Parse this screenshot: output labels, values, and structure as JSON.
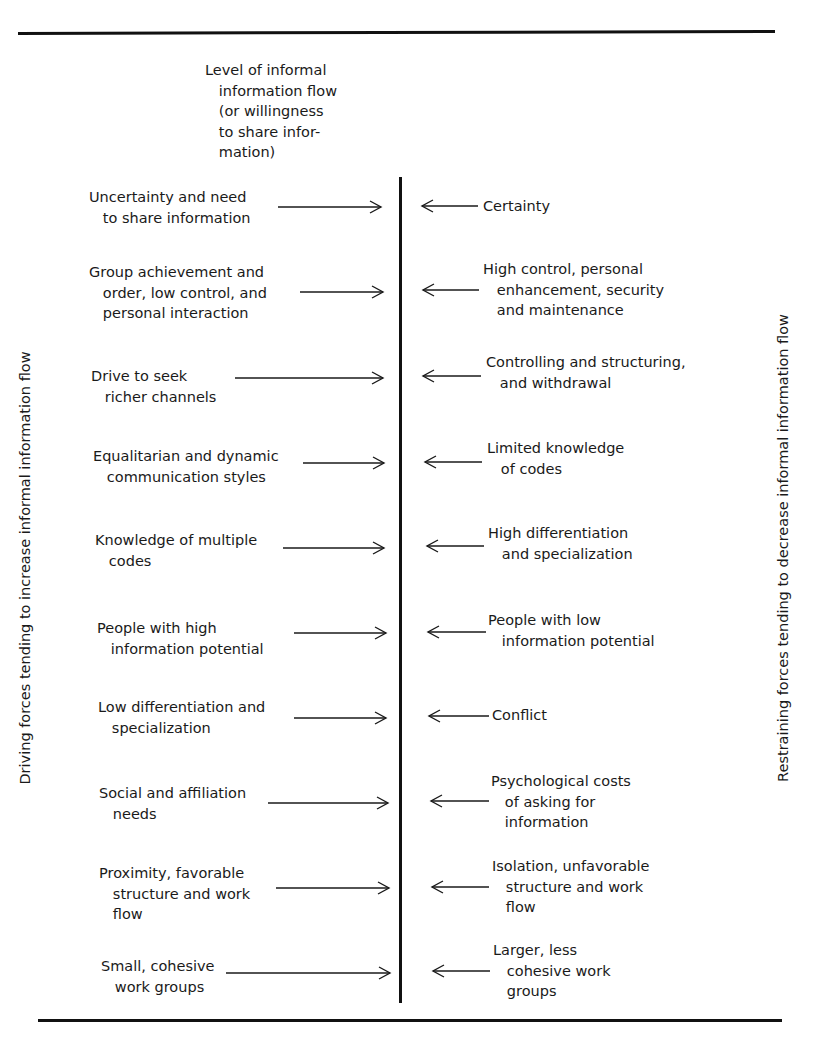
{
  "diagram": {
    "type": "force-field-analysis",
    "center_axis_label": "Level of informal\n   information flow\n   (or willingness\n   to share infor-\n   mation)",
    "left_side_label": "Driving forces tending to increase informal information flow",
    "right_side_label": "Restraining forces tending to decrease informal information flow",
    "driving_forces": [
      {
        "text": "Uncertainty and need\n   to share information"
      },
      {
        "text": "Group achievement and\n   order, low control, and\n   personal interaction"
      },
      {
        "text": "Drive to seek\n   richer channels"
      },
      {
        "text": "Equalitarian and dynamic\n   communication styles"
      },
      {
        "text": "Knowledge of multiple\n   codes"
      },
      {
        "text": "People with high\n   information potential"
      },
      {
        "text": "Low differentiation and\n   specialization"
      },
      {
        "text": "Social and affiliation\n   needs"
      },
      {
        "text": "Proximity, favorable\n   structure and work\n   flow"
      },
      {
        "text": "Small, cohesive\n   work groups"
      }
    ],
    "restraining_forces": [
      {
        "text": "Certainty"
      },
      {
        "text": "High control, personal\n   enhancement, security\n   and maintenance"
      },
      {
        "text": "Controlling and structuring,\n   and withdrawal"
      },
      {
        "text": "Limited knowledge\n   of codes"
      },
      {
        "text": "High differentiation\n   and specialization"
      },
      {
        "text": "People with low\n   information potential"
      },
      {
        "text": "Conflict"
      },
      {
        "text": "Psychological costs\n   of asking for\n   information"
      },
      {
        "text": "Isolation, unfavorable\n   structure and work\n   flow"
      },
      {
        "text": "Larger, less\n   cohesive work\n   groups"
      }
    ]
  }
}
